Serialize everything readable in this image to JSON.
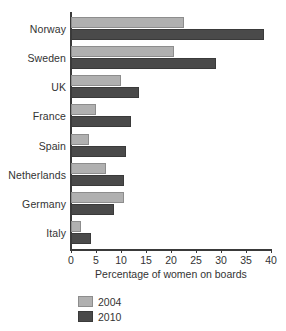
{
  "chart_data": {
    "type": "bar",
    "orientation": "horizontal",
    "title": "",
    "categories": [
      "Norway",
      "Sweden",
      "UK",
      "France",
      "Spain",
      "Netherlands",
      "Germany",
      "Italy"
    ],
    "series": [
      {
        "name": "2004",
        "color": "#b0b0b0",
        "values": [
          22.5,
          20.5,
          10,
          5,
          3.5,
          7,
          10.5,
          2
        ]
      },
      {
        "name": "2010",
        "color": "#4a4a4a",
        "values": [
          38.5,
          29,
          13.5,
          12,
          11,
          10.5,
          8.5,
          4
        ]
      }
    ],
    "xlabel": "Percentage of women on boards",
    "ylabel": "",
    "xlim": [
      0,
      40
    ],
    "xticks": [
      0,
      5,
      10,
      15,
      20,
      25,
      30,
      35,
      40
    ],
    "xtick_labels": [
      "0",
      "5",
      "10",
      "15",
      "20",
      "25",
      "30",
      "35",
      "40"
    ],
    "grid": false,
    "legend_position": "bottom-left"
  }
}
